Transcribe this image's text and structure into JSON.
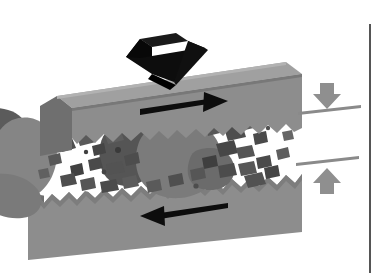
{
  "figure": {
    "background_color": "#ffffff",
    "canvas": {
      "width": 382,
      "height": 273
    }
  },
  "palette": {
    "block_top_face": "#9c9c9c",
    "block_front_face": "#8d8d8d",
    "block_side_face": "#6f6f6f",
    "block_edge": "#5f5f5f",
    "gouge_void": "#ffffff",
    "grain_dark": "#4a4a4a",
    "grain_mid": "#6b6b6b",
    "clast_large": "#7b7b7b",
    "clast_dark": "#555555",
    "arrow_black": "#0d0d0d",
    "arrow_gray": "#8f8f8f",
    "rule_line": "#8a8a8a",
    "border_line": "#555555"
  },
  "annotations": {
    "compression_arrow_top": {
      "name": "compression-arrow",
      "direction": "down",
      "color": "#0d0d0d",
      "style": "3d-block-arrow"
    },
    "shear_arrow_upper": {
      "name": "shear-arrow-right",
      "direction": "right",
      "color": "#0d0d0d"
    },
    "shear_arrow_lower": {
      "name": "shear-arrow-left",
      "direction": "left",
      "color": "#0d0d0d"
    },
    "closure_arrow_upper": {
      "name": "closure-arrow-down",
      "direction": "down",
      "color": "#8f8f8f"
    },
    "closure_arrow_lower": {
      "name": "closure-arrow-up",
      "direction": "up",
      "color": "#8f8f8f"
    },
    "reference_line_upper": {
      "name": "reference-line-upper",
      "color": "#8a8a8a"
    },
    "reference_line_lower": {
      "name": "reference-line-lower",
      "color": "#8a8a8a"
    },
    "panel_divider": {
      "name": "panel-divider-line",
      "color": "#555555",
      "orientation": "vertical"
    }
  },
  "geometry": {
    "block_upper": {
      "top_face": "76,73 300,51 300,78 70,100",
      "front_face": "70,100 300,78 300,132 70,152",
      "left_face": "70,100 76,73 76,126 70,152"
    },
    "block_lower": {
      "front_face": "40,193 300,168 300,232 40,258",
      "left_face": "30,200 40,193 40,258 30,250"
    }
  },
  "grains": [
    {
      "x": 64,
      "y": 146,
      "w": 13,
      "h": 9,
      "r": -18,
      "fill": "#4f4f4f"
    },
    {
      "x": 82,
      "y": 140,
      "w": 15,
      "h": 10,
      "r": -30,
      "fill": "#5a5a5a"
    },
    {
      "x": 98,
      "y": 148,
      "w": 11,
      "h": 8,
      "r": 10,
      "fill": "#454545"
    },
    {
      "x": 112,
      "y": 138,
      "w": 16,
      "h": 10,
      "r": -22,
      "fill": "#5f5f5f"
    },
    {
      "x": 95,
      "y": 163,
      "w": 12,
      "h": 9,
      "r": 25,
      "fill": "#4a4a4a"
    },
    {
      "x": 113,
      "y": 168,
      "w": 14,
      "h": 9,
      "r": -12,
      "fill": "#535353"
    },
    {
      "x": 76,
      "y": 170,
      "w": 10,
      "h": 8,
      "r": 40,
      "fill": "#414141"
    },
    {
      "x": 131,
      "y": 160,
      "w": 12,
      "h": 8,
      "r": -35,
      "fill": "#4d4d4d"
    },
    {
      "x": 212,
      "y": 128,
      "w": 14,
      "h": 10,
      "r": -28,
      "fill": "#585858"
    },
    {
      "x": 231,
      "y": 134,
      "w": 16,
      "h": 10,
      "r": -15,
      "fill": "#4e4e4e"
    },
    {
      "x": 247,
      "y": 126,
      "w": 11,
      "h": 8,
      "r": 20,
      "fill": "#606060"
    },
    {
      "x": 224,
      "y": 150,
      "w": 15,
      "h": 10,
      "r": -40,
      "fill": "#474747"
    },
    {
      "x": 243,
      "y": 152,
      "w": 13,
      "h": 9,
      "r": 12,
      "fill": "#555555"
    },
    {
      "x": 258,
      "y": 140,
      "w": 10,
      "h": 8,
      "r": -10,
      "fill": "#4a4a4a"
    },
    {
      "x": 209,
      "y": 163,
      "w": 12,
      "h": 9,
      "r": 30,
      "fill": "#3f3f3f"
    },
    {
      "x": 265,
      "y": 116,
      "w": 9,
      "h": 7,
      "r": 15,
      "fill": "#6a6a6a"
    },
    {
      "x": 274,
      "y": 122,
      "w": 8,
      "h": 6,
      "r": -20,
      "fill": "#585858"
    }
  ]
}
